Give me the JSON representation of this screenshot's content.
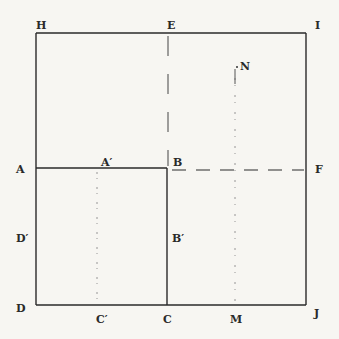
{
  "diagram": {
    "type": "geometric-square-subdivision",
    "colors": {
      "background": "#f7f6f2",
      "ink": "#2a2a2a",
      "faint": "#8a8a8a"
    },
    "points": {
      "H": {
        "label": "H",
        "x": 36,
        "y": 33
      },
      "E": {
        "label": "E",
        "x": 168,
        "y": 33
      },
      "I": {
        "label": "I",
        "x": 306,
        "y": 33
      },
      "A": {
        "label": "A",
        "x": 36,
        "y": 168
      },
      "A_prime": {
        "label": "A′",
        "x": 97,
        "y": 168
      },
      "B": {
        "label": "B",
        "x": 167,
        "y": 168
      },
      "F": {
        "label": "F",
        "x": 306,
        "y": 170
      },
      "D_prime": {
        "label": "D′",
        "x": 36,
        "y": 237
      },
      "B_prime": {
        "label": "B′",
        "x": 167,
        "y": 237
      },
      "D": {
        "label": "D",
        "x": 36,
        "y": 305
      },
      "C_prime": {
        "label": "C′",
        "x": 97,
        "y": 305
      },
      "C": {
        "label": "C",
        "x": 167,
        "y": 305
      },
      "M": {
        "label": "M",
        "x": 235,
        "y": 305
      },
      "J": {
        "label": "J",
        "x": 306,
        "y": 305
      },
      "N": {
        "label": "N",
        "x": 235,
        "y": 66
      }
    },
    "segments": [
      {
        "name": "HI",
        "from": "H",
        "to": "I",
        "style": "solid"
      },
      {
        "name": "IJ",
        "from": "I",
        "to": "J",
        "style": "solid"
      },
      {
        "name": "DJ",
        "from": "D",
        "to": "J",
        "style": "solid"
      },
      {
        "name": "HD",
        "from": "H",
        "to": "D",
        "style": "solid"
      },
      {
        "name": "AB",
        "from": "A",
        "to": "B",
        "style": "solid"
      },
      {
        "name": "BC",
        "from": "B",
        "to": "C",
        "style": "solid"
      },
      {
        "name": "EB",
        "from": "E",
        "to": "B",
        "style": "dashed"
      },
      {
        "name": "BF",
        "from": "B",
        "to": "F",
        "style": "dashed"
      },
      {
        "name": "A'C'",
        "from": "A_prime",
        "to": "C_prime",
        "style": "dotted"
      },
      {
        "name": "NM",
        "from": "N",
        "to": "M",
        "style": "dotted"
      }
    ]
  }
}
